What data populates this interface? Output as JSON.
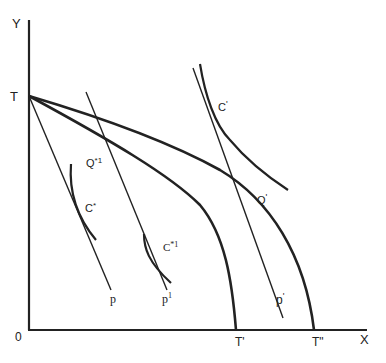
{
  "diagram": {
    "type": "production-possibility-frontier",
    "axes": {
      "y_label": "Y",
      "x_label": "X",
      "origin_label": "0",
      "intercept_label": "T"
    },
    "frontiers": [
      {
        "id": "TT1",
        "end_label": "T'"
      },
      {
        "id": "TT2",
        "end_label": "T\""
      }
    ],
    "price_lines": [
      {
        "id": "p",
        "label": "p"
      },
      {
        "id": "p1a",
        "label": "p",
        "sup": "1"
      },
      {
        "id": "p1b",
        "label": "p",
        "sup": "1"
      }
    ],
    "indifference_curves": [
      {
        "id": "C-star",
        "label": "C*"
      },
      {
        "id": "C-star-1",
        "label": "C*1"
      },
      {
        "id": "C-1",
        "label": "C'"
      }
    ],
    "points": [
      {
        "id": "Q-star-1",
        "label": "Q*1"
      },
      {
        "id": "Q-1",
        "label": "Q'"
      }
    ],
    "labels": {
      "Y": "Y",
      "X": "X",
      "O": "0",
      "T": "T",
      "T1": "T'",
      "T2": "T\"",
      "p": "p",
      "p1_left": "p",
      "p1_left_sup": "1",
      "p1_right": "p",
      "p1_right_sup": "'",
      "C_star": "C",
      "C_star_sup": "*",
      "C_star1": "C",
      "C_star1_sup": "*1",
      "C1": "C",
      "C1_sup": "'",
      "Q_star1": "Q",
      "Q_star1_sup": "*1",
      "Q1": "Q",
      "Q1_sup": "'"
    },
    "colors": {
      "line": "#222222",
      "background": "#ffffff"
    }
  }
}
